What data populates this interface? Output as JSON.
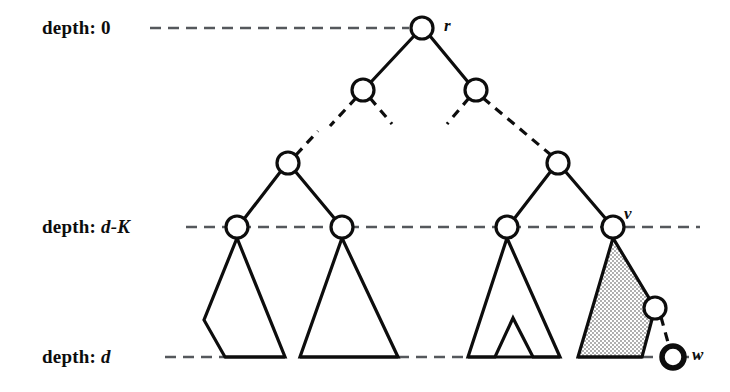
{
  "figure": {
    "background_color": "#ffffff",
    "ink_color": "#0d0d0d",
    "shade_color": "#d9d9d9"
  },
  "depth_labels": [
    {
      "prefix": "depth:",
      "value": "0",
      "y": 28,
      "name": "depth-0"
    },
    {
      "prefix": "depth:",
      "value": "d-K",
      "y": 227,
      "name": "depth-d-minus-k"
    },
    {
      "prefix": "depth:",
      "value": "d",
      "y": 357,
      "name": "depth-d"
    }
  ],
  "node_labels": [
    {
      "text": "r",
      "x": 444,
      "y": 16,
      "name": "node-label-r"
    },
    {
      "text": "v",
      "x": 624,
      "y": 207,
      "name": "node-label-v"
    },
    {
      "text": "w",
      "x": 692,
      "y": 348,
      "name": "node-label-w"
    }
  ],
  "nodes": [
    {
      "id": "r",
      "cx": 422,
      "cy": 28,
      "r": 11,
      "stroke": 3,
      "name": "node-root"
    },
    {
      "id": "l2a",
      "cx": 363,
      "cy": 90,
      "r": 11,
      "stroke": 3,
      "name": "node-level2-left"
    },
    {
      "id": "l2b",
      "cx": 476,
      "cy": 90,
      "r": 11,
      "stroke": 3,
      "name": "node-level2-right"
    },
    {
      "id": "l3a",
      "cx": 288,
      "cy": 163,
      "r": 11,
      "stroke": 3,
      "name": "node-level3-left"
    },
    {
      "id": "l3b",
      "cx": 558,
      "cy": 163,
      "r": 11,
      "stroke": 3,
      "name": "node-level3-right"
    },
    {
      "id": "k1",
      "cx": 237,
      "cy": 227,
      "r": 11,
      "stroke": 3,
      "name": "node-depth-dk-1"
    },
    {
      "id": "k2",
      "cx": 342,
      "cy": 227,
      "r": 11,
      "stroke": 3,
      "name": "node-depth-dk-2"
    },
    {
      "id": "k3",
      "cx": 507,
      "cy": 227,
      "r": 11,
      "stroke": 3,
      "name": "node-depth-dk-3"
    },
    {
      "id": "v",
      "cx": 613,
      "cy": 227,
      "r": 11,
      "stroke": 3,
      "name": "node-v"
    },
    {
      "id": "x",
      "cx": 655,
      "cy": 308,
      "r": 11,
      "stroke": 3,
      "name": "node-intermediate"
    },
    {
      "id": "w",
      "cx": 673,
      "cy": 357,
      "r": 11,
      "stroke": 5,
      "name": "node-w"
    }
  ],
  "depth_lines": [
    {
      "name": "dashed-line-depth-0",
      "x1": 150,
      "x2": 410,
      "y": 28
    },
    {
      "name": "dashed-line-depth-dk",
      "x1": 186,
      "x2": 700,
      "y": 227
    },
    {
      "name": "dashed-line-depth-d",
      "x1": 165,
      "x2": 700,
      "y": 357
    }
  ],
  "subtrees": [
    {
      "name": "subtree-pentagon-1",
      "shaded": false
    },
    {
      "name": "subtree-triangle-2",
      "shaded": false
    },
    {
      "name": "subtree-notched-3",
      "shaded": false
    },
    {
      "name": "subtree-shaded-4",
      "shaded": true
    }
  ],
  "edges": [
    {
      "name": "edge-root-to-level2-left",
      "style": "solid"
    },
    {
      "name": "edge-root-to-level2-right",
      "style": "solid"
    },
    {
      "name": "edge-level2-left-down",
      "style": "dashed"
    },
    {
      "name": "edge-level2-right-down",
      "style": "dashed"
    },
    {
      "name": "edge-level3-to-dk",
      "style": "solid"
    },
    {
      "name": "edge-v-to-w",
      "style": "dashed"
    }
  ]
}
